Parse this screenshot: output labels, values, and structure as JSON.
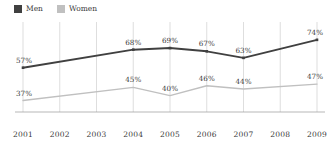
{
  "legend": {
    "position": "top-left",
    "entries": [
      {
        "label": "Men",
        "color": "#404040",
        "swatch_name": "legend-swatch-men"
      },
      {
        "label": "Women",
        "color": "#c0c0c0",
        "swatch_name": "legend-swatch-women"
      }
    ]
  },
  "chart_data": {
    "type": "line",
    "title": "",
    "subtitle": "",
    "xlabel": "",
    "ylabel": "",
    "grid": "vertical-only",
    "legend_position": "top-left",
    "categories": [
      "2001",
      "2002",
      "2003",
      "2004",
      "2005",
      "2006",
      "2007",
      "2008",
      "2009"
    ],
    "ylim": [
      30,
      80
    ],
    "xlim": [
      "2001",
      "2009"
    ],
    "series": [
      {
        "name": "Men",
        "color": "#404040",
        "line_width": 1.9,
        "marker": "square",
        "values": [
          57,
          null,
          null,
          68,
          69,
          67,
          63,
          null,
          74
        ],
        "labels": [
          "57%",
          "",
          "",
          "68%",
          "69%",
          "67%",
          "63%",
          "",
          "74%"
        ]
      },
      {
        "name": "Women",
        "color": "#c0c0c0",
        "line_width": 1.4,
        "marker": "none",
        "values": [
          37,
          null,
          null,
          45,
          40,
          46,
          44,
          null,
          47
        ],
        "labels": [
          "37%",
          "",
          "",
          "45%",
          "40%",
          "46%",
          "44%",
          "",
          "47%"
        ]
      }
    ]
  }
}
